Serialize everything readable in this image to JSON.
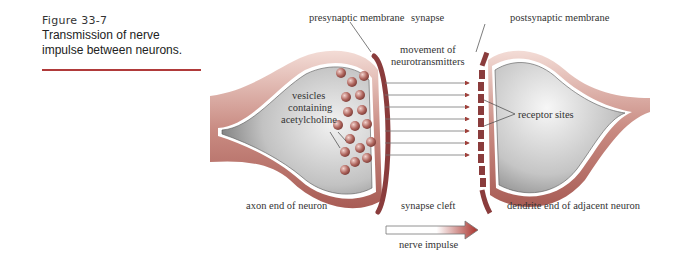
{
  "caption": {
    "figure_number": "Figure 33-7",
    "title_line1": "Transmission of nerve",
    "title_line2": "impulse between neurons."
  },
  "labels": {
    "presynaptic_membrane": "presynaptic membrane",
    "synapse": "synapse",
    "postsynaptic_membrane": "postsynaptic membrane",
    "movement_line1": "movement of",
    "movement_line2": "neurotransmitters",
    "vesicles_line1": "vesicles",
    "vesicles_line2": "containing",
    "vesicles_line3": "acetylcholine",
    "receptor_sites": "receptor sites",
    "axon_end": "axon end of neuron",
    "synapse_cleft": "synapse cleft",
    "dendrite_end": "dendrite end of adjacent neuron",
    "nerve_impulse": "nerve impulse"
  },
  "colors": {
    "accent_rule": "#b03a3a",
    "membrane": "#8a3c3c",
    "sheath": "#c98b82",
    "cytoplasm": "#b5b5b5",
    "vesicle": "#a8605a"
  }
}
